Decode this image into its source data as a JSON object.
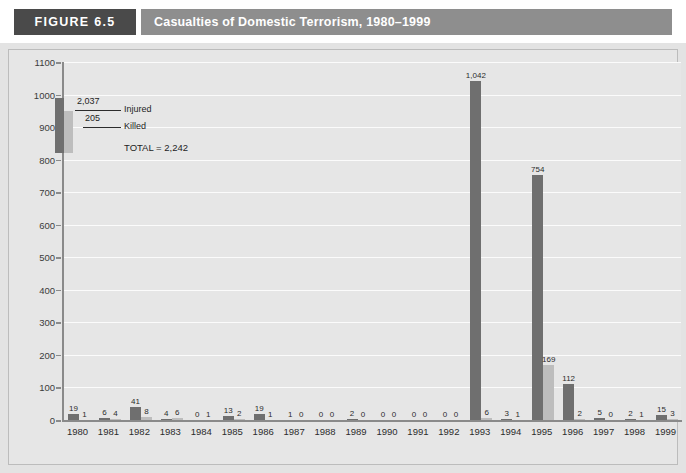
{
  "header": {
    "figure_number": "FIGURE 6.5",
    "title": "Casualties of Domestic Terrorism, 1980–1999",
    "number_box_color": "#4a4a4a",
    "title_bar_color": "#8e8e8e"
  },
  "legend": {
    "injured_label": "Injured",
    "killed_label": "Killed",
    "injured_value": "2,037",
    "killed_value": "205",
    "total_text": "TOTAL = 2,242",
    "injured_color": "#6f6f6f",
    "killed_color": "#bdbdbd"
  },
  "chart_data": {
    "type": "bar",
    "title": "Casualties of Domestic Terrorism, 1980–1999",
    "xlabel": "",
    "ylabel": "",
    "ylim": [
      0,
      1100
    ],
    "ytick_step": 100,
    "yticks": [
      "0",
      "100",
      "200",
      "300",
      "400",
      "500",
      "600",
      "700",
      "800",
      "900",
      "1000",
      "1100"
    ],
    "grid": true,
    "grid_color": "#fbfbfb",
    "plot_background": "#e6e6e6",
    "legend_position": "upper-left-inset",
    "categories": [
      "1980",
      "1981",
      "1982",
      "1983",
      "1984",
      "1985",
      "1986",
      "1987",
      "1988",
      "1989",
      "1990",
      "1991",
      "1992",
      "1993",
      "1994",
      "1995",
      "1996",
      "1997",
      "1998",
      "1999"
    ],
    "series": [
      {
        "name": "Injured",
        "color": "#6f6f6f",
        "values": [
          19,
          6,
          41,
          4,
          0,
          13,
          19,
          1,
          0,
          2,
          0,
          0,
          0,
          1042,
          3,
          754,
          112,
          5,
          2,
          15
        ],
        "labels": [
          "19",
          "6",
          "41",
          "4",
          "0",
          "13",
          "19",
          "1",
          "0",
          "2",
          "0",
          "0",
          "0",
          "1,042",
          "3",
          "754",
          "112",
          "5",
          "2",
          "15"
        ],
        "total": 2037
      },
      {
        "name": "Killed",
        "color": "#bdbdbd",
        "values": [
          1,
          4,
          8,
          6,
          1,
          2,
          1,
          0,
          0,
          0,
          0,
          0,
          0,
          6,
          1,
          169,
          2,
          0,
          1,
          3
        ],
        "labels": [
          "1",
          "4",
          "8",
          "6",
          "1",
          "2",
          "1",
          "0",
          "0",
          "0",
          "0",
          "0",
          "0",
          "6",
          "1",
          "169",
          "2",
          "0",
          "1",
          "3"
        ],
        "total": 205
      }
    ],
    "grand_total": 2242
  }
}
